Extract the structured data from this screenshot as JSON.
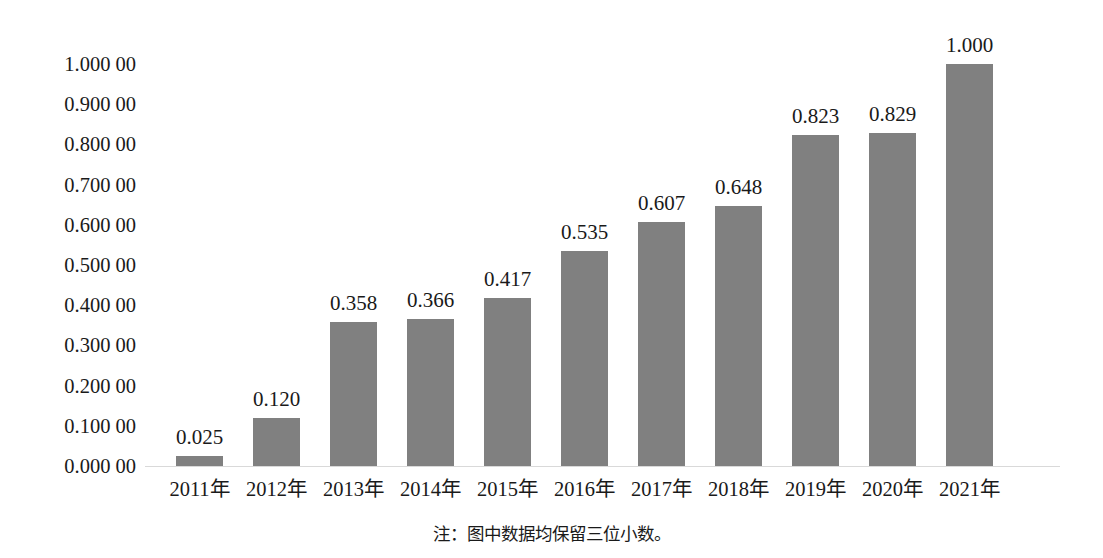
{
  "chart_data": {
    "type": "bar",
    "title": "",
    "subtitle": "",
    "xlabel": "",
    "ylabel": "",
    "categories": [
      "2011年",
      "2012年",
      "2013年",
      "2014年",
      "2015年",
      "2016年",
      "2017年",
      "2018年",
      "2019年",
      "2020年",
      "2021年"
    ],
    "values": [
      0.025,
      0.12,
      0.358,
      0.366,
      0.417,
      0.535,
      0.607,
      0.648,
      0.823,
      0.829,
      1.0
    ],
    "data_labels": [
      "0.025",
      "0.120",
      "0.358",
      "0.366",
      "0.417",
      "0.535",
      "0.607",
      "0.648",
      "0.823",
      "0.829",
      "1.000"
    ],
    "ylim": [
      0,
      1.0
    ],
    "y_ticks": [
      0.0,
      0.1,
      0.2,
      0.3,
      0.4,
      0.5,
      0.6,
      0.7,
      0.8,
      0.9,
      1.0
    ],
    "y_tick_labels": [
      "0.000 00",
      "0.100 00",
      "0.200 00",
      "0.300 00",
      "0.400 00",
      "0.500 00",
      "0.600 00",
      "0.700 00",
      "0.800 00",
      "0.900 00",
      "1.000 00"
    ],
    "grid": false,
    "legend": "none",
    "bar_color": "#808080",
    "axis_color": "#d9d9d9",
    "text_color": "#1a1a1a",
    "background": "#ffffff"
  },
  "note": {
    "text": "注：图中数据均保留三位小数。"
  }
}
